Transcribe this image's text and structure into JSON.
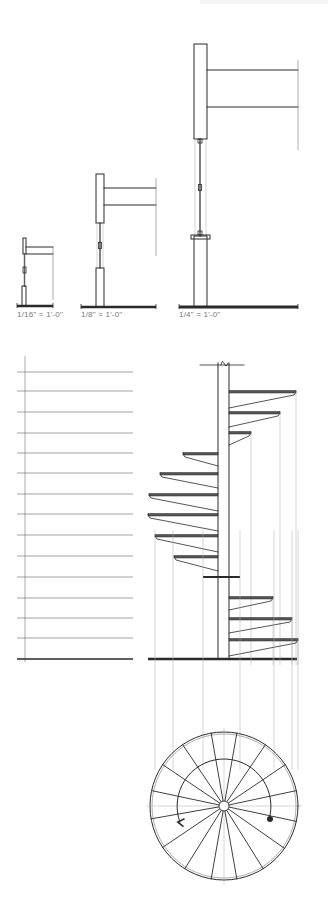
{
  "scale_labels": [
    {
      "text": "1/16\" = 1'-0\"",
      "x": 17,
      "y": 314
    },
    {
      "text": "1/8\" = 1'-0\"",
      "x": 81,
      "y": 314
    },
    {
      "text": "1/4\" = 1'-0\"",
      "x": 179,
      "y": 314
    }
  ],
  "colors": {
    "ink": "#2a2a2a",
    "line": "#777777",
    "faint": "#aaaaaa",
    "background": "#ffffff"
  },
  "scale_drawings": [
    {
      "name": "scale-1-16",
      "ground": [
        17,
        306,
        53
      ],
      "ground_thick": 2.5,
      "post_top": [
        23,
        238,
        26,
        254
      ],
      "beam_top": [
        26,
        247,
        53,
        247
      ],
      "beam_bot": [
        26,
        254,
        53,
        254
      ],
      "rail_x": 24.5,
      "rail_y": [
        254,
        286
      ],
      "base": [
        22,
        286,
        26,
        306
      ],
      "dim_x": 53,
      "dim_y": [
        247,
        300
      ]
    },
    {
      "name": "scale-1-8",
      "ground": [
        81,
        307,
        156
      ],
      "ground_thick": 2.5,
      "post_top": [
        96,
        174,
        104,
        223
      ],
      "beam_top": [
        104,
        188,
        156,
        188
      ],
      "beam_bot": [
        104,
        205,
        156,
        205
      ],
      "rail_x": 100,
      "rail_y": [
        223,
        268
      ],
      "base": [
        96,
        268,
        104,
        307
      ],
      "dim_x": 156,
      "dim_y": [
        178,
        256
      ]
    },
    {
      "name": "scale-1-4",
      "ground": [
        179,
        307,
        298
      ],
      "ground_thick": 3,
      "post_top": [
        194,
        44,
        207,
        139
      ],
      "beam_top": [
        207,
        70,
        298,
        70
      ],
      "beam_bot": [
        207,
        107,
        298,
        107
      ],
      "rail_x": 200,
      "rail_y": [
        139,
        236
      ],
      "base": [
        194,
        236,
        207,
        307
      ],
      "dim_x": 298,
      "dim_y": [
        60,
        150
      ]
    }
  ],
  "elevation_scale": {
    "x_axis": 25,
    "x_start": 17,
    "x_end": 133,
    "ticks_y": [
      372,
      391,
      412,
      433,
      453,
      473,
      494,
      514,
      535,
      556,
      577,
      598,
      618,
      638,
      659
    ]
  },
  "stair": {
    "ground_y": 659,
    "ground_x": [
      148,
      297
    ],
    "post_x": [
      218,
      229
    ],
    "post_top": 363,
    "treads": [
      {
        "y": 392,
        "side": "right",
        "x": 296,
        "depth": 16
      },
      {
        "y": 413,
        "side": "right",
        "x": 280,
        "depth": 14
      },
      {
        "y": 433,
        "side": "right",
        "x": 251,
        "depth": 12
      },
      {
        "y": 454,
        "side": "left",
        "x": 183,
        "depth": 12
      },
      {
        "y": 474,
        "side": "left",
        "x": 160,
        "depth": 14
      },
      {
        "y": 495,
        "side": "left",
        "x": 149,
        "depth": 16
      },
      {
        "y": 515,
        "side": "left",
        "x": 148,
        "depth": 16
      },
      {
        "y": 536,
        "side": "left",
        "x": 155,
        "depth": 16
      },
      {
        "y": 557,
        "side": "left",
        "x": 174,
        "depth": 14
      },
      {
        "y": 577,
        "side": "both",
        "x_left": 203,
        "x_right": 240,
        "depth": 0
      },
      {
        "y": 598,
        "side": "right",
        "x": 273,
        "depth": 12
      },
      {
        "y": 619,
        "side": "right",
        "x": 292,
        "depth": 14
      },
      {
        "y": 640,
        "side": "right",
        "x": 298,
        "depth": 16
      }
    ],
    "projection_x": [
      155,
      173,
      203,
      240,
      274,
      292,
      298
    ]
  },
  "plan": {
    "cx": 224,
    "cy": 806,
    "r": 74,
    "hub_r": 5,
    "spokes_deg": [
      -80,
      -100,
      -56,
      -124,
      -34,
      -146,
      -12,
      -168,
      12,
      170,
      35,
      146,
      58,
      122,
      80,
      100
    ],
    "arc_r": 47,
    "arc_start_deg": 12,
    "arc_end_deg": -200,
    "dot": [
      270,
      819
    ]
  }
}
